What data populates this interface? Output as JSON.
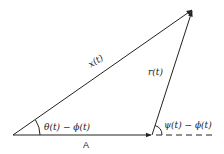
{
  "diagram": {
    "type": "vector-triangle",
    "vectors": [
      {
        "name": "x",
        "label": "x(t)",
        "from": "origin",
        "to": "tip"
      },
      {
        "name": "A",
        "label": "A",
        "from": "origin",
        "to": "A-end"
      },
      {
        "name": "r",
        "label": "r(t)",
        "from": "A-end",
        "to": "tip"
      }
    ],
    "angles": [
      {
        "name": "theta",
        "label": "θ(t) − ϕ(t)",
        "at": "origin"
      },
      {
        "name": "psi",
        "label": "ψ(t) − ϕ(t)",
        "at": "A-end"
      }
    ],
    "reference_line": {
      "style": "dashed",
      "extends_from": "A-end"
    }
  },
  "labels": {
    "x": "x(t)",
    "r": "r(t)",
    "A": "A",
    "theta": "θ(t) − ϕ(t)",
    "psi": "ψ(t) − ϕ(t)"
  },
  "colors": {
    "stroke": "#222222",
    "background": "#ffffff"
  }
}
